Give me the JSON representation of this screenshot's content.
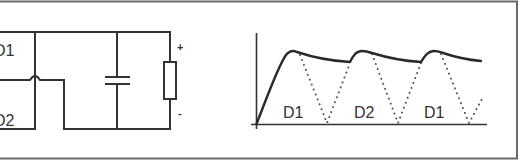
{
  "figure": {
    "colors": {
      "background": "#ffffff",
      "line": "#333333",
      "frame": "#6a6a6a"
    }
  },
  "circuit": {
    "diode_labels": [
      "D1",
      "D2"
    ],
    "polarity": {
      "positive": "+",
      "negative": "-"
    },
    "components": [
      "capacitor",
      "load-resistor"
    ]
  },
  "waveform": {
    "pulse_labels": [
      "D1",
      "D2",
      "D1"
    ],
    "axes": {
      "x_axis": "time",
      "y_axis": "voltage"
    },
    "series": [
      {
        "name": "smoothed-output",
        "style": "solid"
      },
      {
        "name": "rectified-half-waves",
        "style": "dotted"
      }
    ]
  }
}
